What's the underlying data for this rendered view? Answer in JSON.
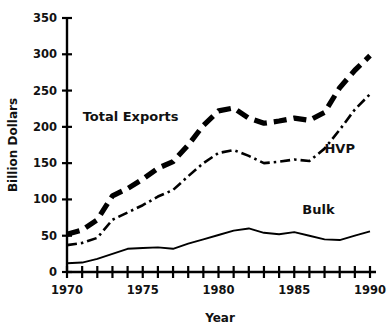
{
  "chart_data": {
    "type": "line",
    "title": "",
    "xlabel": "Year",
    "ylabel": "Billion Dollars",
    "xlim": [
      1970,
      1990
    ],
    "ylim": [
      0,
      350
    ],
    "yticks": [
      0,
      50,
      100,
      150,
      200,
      250,
      300,
      350
    ],
    "ytick_labels": [
      "0",
      "50",
      "100",
      "150",
      "200",
      "250",
      "300",
      "350"
    ],
    "xticks": [
      1970,
      1971,
      1972,
      1973,
      1974,
      1975,
      1976,
      1977,
      1978,
      1979,
      1980,
      1981,
      1982,
      1983,
      1984,
      1985,
      1986,
      1987,
      1988,
      1989,
      1990
    ],
    "xtick_labels_shown": [
      "1970",
      "1975",
      "1980",
      "1985",
      "1990"
    ],
    "xtick_labels_shown_at": [
      1970,
      1975,
      1980,
      1985,
      1990
    ],
    "grid": false,
    "legend_position": "inline-annotations",
    "x": [
      1970,
      1971,
      1972,
      1973,
      1974,
      1975,
      1976,
      1977,
      1978,
      1979,
      1980,
      1981,
      1982,
      1983,
      1984,
      1985,
      1986,
      1987,
      1988,
      1989,
      1990
    ],
    "series": [
      {
        "name": "Total Exports",
        "style": "thick-dashed",
        "label_x": 1974.2,
        "label_y": 208,
        "values": [
          52,
          58,
          72,
          105,
          115,
          128,
          143,
          152,
          175,
          202,
          222,
          226,
          212,
          205,
          208,
          212,
          209,
          220,
          254,
          278,
          298
        ]
      },
      {
        "name": "HVP",
        "style": "dash-dot",
        "label_x": 1988.0,
        "label_y": 164,
        "values": [
          37,
          40,
          47,
          72,
          82,
          92,
          104,
          113,
          132,
          150,
          164,
          168,
          160,
          150,
          152,
          155,
          153,
          170,
          196,
          224,
          245
        ]
      },
      {
        "name": "Bulk",
        "style": "solid-thin",
        "label_x": 1986.6,
        "label_y": 80,
        "values": [
          12,
          13,
          18,
          25,
          32,
          33,
          34,
          32,
          39,
          45,
          51,
          57,
          60,
          54,
          52,
          55,
          50,
          45,
          44,
          50,
          56
        ]
      }
    ]
  },
  "axes": {
    "y_axis_title": "Billion Dollars",
    "x_axis_title": "Year"
  }
}
